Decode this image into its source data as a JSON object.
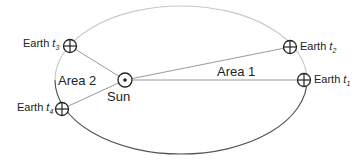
{
  "diagram": {
    "sun": {
      "label": "Sun",
      "icon": "sun-symbol-icon"
    },
    "earth_positions": [
      {
        "id": "t1",
        "label": "Earth",
        "time": "t",
        "sub": "1",
        "icon": "earth-symbol-icon"
      },
      {
        "id": "t2",
        "label": "Earth",
        "time": "t",
        "sub": "2",
        "icon": "earth-symbol-icon"
      },
      {
        "id": "t3",
        "label": "Earth",
        "time": "t",
        "sub": "3",
        "icon": "earth-symbol-icon"
      },
      {
        "id": "t4",
        "label": "Earth",
        "time": "t",
        "sub": "4",
        "icon": "earth-symbol-icon"
      }
    ],
    "areas": [
      {
        "label": "Area 1"
      },
      {
        "label": "Area 2"
      }
    ],
    "colors": {
      "orbit_light": "#c8c8c8",
      "orbit_dark": "#555555",
      "line": "#888888",
      "symbol": "#222222"
    }
  }
}
